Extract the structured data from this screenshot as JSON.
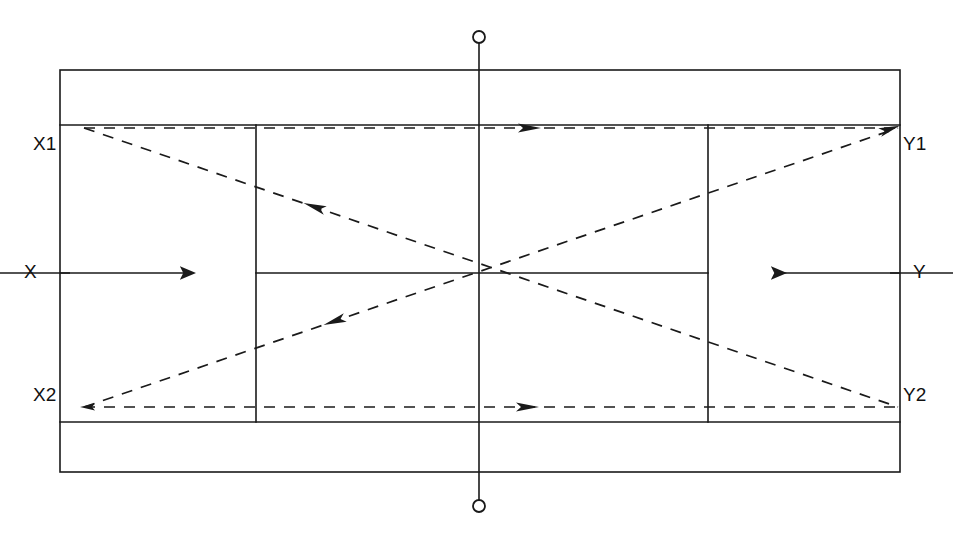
{
  "diagram": {
    "type": "technical-line-drawing",
    "background_color": "#ffffff",
    "line_color": "#1a1a1a",
    "dashed_color": "#1a1a1a"
  },
  "labels": {
    "x1": "X1",
    "x2": "X2",
    "x": "X",
    "y1": "Y1",
    "y2": "Y2",
    "y": "Y"
  },
  "court": {
    "outer_baseline_left_x": 60,
    "outer_baseline_right_x": 900,
    "outer_top_y": 70,
    "outer_bottom_y": 472,
    "doubles_top_y": 125,
    "doubles_bottom_y": 422,
    "service_line_left_x": 256,
    "service_line_right_x": 708,
    "center_service_y": 273,
    "net_x": 479,
    "net_post_top_y": 37,
    "net_post_bottom_y": 506,
    "net_post_radius": 6
  },
  "paths": {
    "top_horizontal": {
      "name": "top-sideline-travel-path",
      "from_x": 84,
      "from_y": 128,
      "to_x": 898,
      "to_y": 128,
      "arrow_direction": "right",
      "arrow_at_x": 532
    },
    "bottom_horizontal": {
      "name": "bottom-sideline-travel-path",
      "from_x": 84,
      "from_y": 407,
      "to_x": 898,
      "to_y": 407,
      "arrow_direction": "right",
      "arrow_at_x": 530
    },
    "diagonal_descending": {
      "name": "diagonal-x1-to-y2-path",
      "from_x": 84,
      "from_y": 128,
      "to_x": 898,
      "to_y": 407,
      "arrow_direction": "left",
      "arrow_at_x": 312,
      "arrow_at_y": 206
    },
    "diagonal_ascending": {
      "name": "diagonal-x2-to-y1-path",
      "from_x": 84,
      "from_y": 407,
      "to_x": 898,
      "to_y": 128,
      "arrow_direction": "left",
      "arrow_at_x": 332,
      "arrow_at_y": 322
    }
  },
  "dimension_arrows": {
    "left": {
      "name": "left-dimension-arrow",
      "x": 40,
      "top_y": 125,
      "bottom_y": 422,
      "tick_y": 273
    },
    "right": {
      "name": "right-dimension-arrow",
      "x": 928,
      "top_y": 125,
      "bottom_y": 422,
      "tick_y": 273
    }
  }
}
